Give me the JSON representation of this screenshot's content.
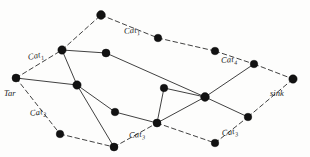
{
  "diagram": {
    "style": "hand-drawn scanned line drawing",
    "background_color": "#fdfdfc",
    "ink_color": "#1c1c1c",
    "node_color": "#121212"
  },
  "labels": {
    "tar": "Tar",
    "sink": "sink",
    "cat1_left": "Cat",
    "cat1_left_sub": "1",
    "cat1_top": "Cat",
    "cat1_top_sub": "1",
    "cat4": "Cat",
    "cat4_sub": "4",
    "cat2": "Cat",
    "cat2_sub": "2",
    "cat3_bottom": "Cat",
    "cat3_bottom_sub": "3",
    "cat3_right": "Cat",
    "cat3_right_sub": "3"
  },
  "chart_data": {
    "type": "graph",
    "nodes": [
      {
        "id": "n1",
        "name": "tar-node",
        "x": 16,
        "y": 78,
        "r": 4.0
      },
      {
        "id": "n2",
        "name": "upper-left-hub",
        "x": 62,
        "y": 50,
        "r": 4.2
      },
      {
        "id": "n3",
        "name": "top-peak",
        "x": 101,
        "y": 15,
        "r": 4.4
      },
      {
        "id": "n4",
        "name": "upper-mid",
        "x": 106,
        "y": 53,
        "r": 4.0
      },
      {
        "id": "n5",
        "name": "top-right-a",
        "x": 158,
        "y": 38,
        "r": 3.8
      },
      {
        "id": "n6",
        "name": "top-right-b",
        "x": 215,
        "y": 51,
        "r": 3.8
      },
      {
        "id": "n7",
        "name": "right-upper",
        "x": 254,
        "y": 64,
        "r": 3.8
      },
      {
        "id": "n8",
        "name": "sink-node",
        "x": 293,
        "y": 79,
        "r": 4.2
      },
      {
        "id": "n9",
        "name": "left-lower",
        "x": 77,
        "y": 85,
        "r": 4.2
      },
      {
        "id": "n10",
        "name": "mid-lower",
        "x": 115,
        "y": 112,
        "r": 3.8
      },
      {
        "id": "n11",
        "name": "center-hub",
        "x": 157,
        "y": 123,
        "r": 4.0
      },
      {
        "id": "n12",
        "name": "mid-center",
        "x": 205,
        "y": 97,
        "r": 4.4
      },
      {
        "id": "n13",
        "name": "upper-center",
        "x": 164,
        "y": 88,
        "r": 3.8
      },
      {
        "id": "n14",
        "name": "right-lower",
        "x": 248,
        "y": 117,
        "r": 3.8
      },
      {
        "id": "n15",
        "name": "bottom-left",
        "x": 60,
        "y": 134,
        "r": 3.8
      },
      {
        "id": "n16",
        "name": "bottom-mid",
        "x": 114,
        "y": 147,
        "r": 4.0
      },
      {
        "id": "n17",
        "name": "bottom-right",
        "x": 215,
        "y": 143,
        "r": 3.8
      }
    ],
    "edges": [
      {
        "from": "n1",
        "to": "n2",
        "style": "dashed"
      },
      {
        "from": "n2",
        "to": "n3",
        "style": "dashed"
      },
      {
        "from": "n3",
        "to": "n5",
        "style": "dashed"
      },
      {
        "from": "n5",
        "to": "n6",
        "style": "dashed"
      },
      {
        "from": "n6",
        "to": "n7",
        "style": "dashed"
      },
      {
        "from": "n7",
        "to": "n8",
        "style": "dashed"
      },
      {
        "from": "n1",
        "to": "n15",
        "style": "dashed"
      },
      {
        "from": "n15",
        "to": "n16",
        "style": "dashed"
      },
      {
        "from": "n16",
        "to": "n11",
        "style": "dashed"
      },
      {
        "from": "n11",
        "to": "n17",
        "style": "dashed"
      },
      {
        "from": "n17",
        "to": "n14",
        "style": "dashed"
      },
      {
        "from": "n14",
        "to": "n8",
        "style": "dashed"
      },
      {
        "from": "n1",
        "to": "n9",
        "style": "solid"
      },
      {
        "from": "n2",
        "to": "n4",
        "style": "solid"
      },
      {
        "from": "n2",
        "to": "n9",
        "style": "solid"
      },
      {
        "from": "n4",
        "to": "n12",
        "style": "solid"
      },
      {
        "from": "n9",
        "to": "n10",
        "style": "solid"
      },
      {
        "from": "n9",
        "to": "n16",
        "style": "solid"
      },
      {
        "from": "n10",
        "to": "n11",
        "style": "solid"
      },
      {
        "from": "n11",
        "to": "n12",
        "style": "solid"
      },
      {
        "from": "n11",
        "to": "n13",
        "style": "solid"
      },
      {
        "from": "n13",
        "to": "n12",
        "style": "solid"
      },
      {
        "from": "n12",
        "to": "n7",
        "style": "solid"
      },
      {
        "from": "n12",
        "to": "n14",
        "style": "solid"
      }
    ],
    "label_positions": [
      {
        "key": "cat1_top",
        "x": 124,
        "y": 26,
        "rotate": -6
      },
      {
        "key": "cat4",
        "x": 221,
        "y": 55,
        "rotate": -4
      },
      {
        "key": "cat1_left",
        "x": 28,
        "y": 52,
        "rotate": -12
      },
      {
        "key": "tar",
        "x": 4,
        "y": 88,
        "rotate": 0
      },
      {
        "key": "sink",
        "x": 270,
        "y": 88,
        "rotate": 0
      },
      {
        "key": "cat2",
        "x": 30,
        "y": 108,
        "rotate": -8
      },
      {
        "key": "cat3_bottom",
        "x": 129,
        "y": 130,
        "rotate": -5
      },
      {
        "key": "cat3_right",
        "x": 222,
        "y": 128,
        "rotate": -9
      }
    ]
  }
}
